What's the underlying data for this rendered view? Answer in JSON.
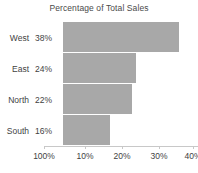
{
  "chart_data": {
    "type": "bar",
    "orientation": "horizontal",
    "title": "Percentage of Total Sales",
    "xlabel": "",
    "ylabel": "",
    "categories": [
      "West",
      "East",
      "North",
      "South"
    ],
    "values": [
      38,
      24,
      22,
      16
    ],
    "value_labels": [
      "38%",
      "24%",
      "22%",
      "16%"
    ],
    "xticks": [
      "100%",
      "10%",
      "20%",
      "30%",
      "40%"
    ],
    "xtick_positions_px": [
      44,
      85,
      122,
      159,
      193
    ],
    "bar_end_px": [
      179,
      136,
      132,
      110
    ],
    "xlim": [
      0,
      40
    ],
    "grid": false,
    "legend": null,
    "bar_color": "#a8a8a8",
    "axis_color": "#c8c8c8",
    "text_color": "#3f3f3f",
    "background": "#ffffff"
  }
}
